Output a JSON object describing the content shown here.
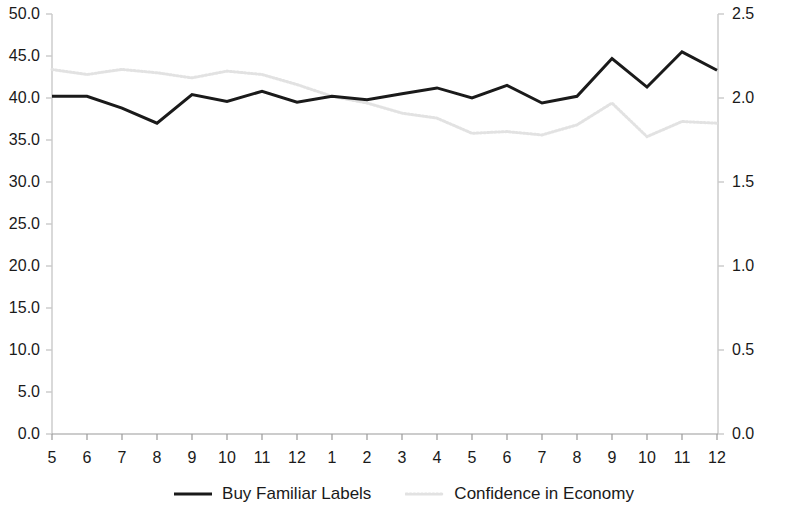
{
  "chart_data": {
    "type": "line",
    "title": "",
    "subtitle": "",
    "xlabel": "",
    "ylabel": "",
    "grid": false,
    "legend_position": "bottom",
    "x": [
      "5",
      "6",
      "7",
      "8",
      "9",
      "10",
      "11",
      "12",
      "1",
      "2",
      "3",
      "4",
      "5",
      "6",
      "7",
      "8",
      "9",
      "10",
      "11",
      "12"
    ],
    "xtick_labels": [
      "5",
      "6",
      "7",
      "8",
      "9",
      "10",
      "11",
      "12",
      "1",
      "2",
      "3",
      "4",
      "5",
      "6",
      "7",
      "8",
      "9",
      "10",
      "11",
      "12"
    ],
    "axes": {
      "left": {
        "label": "",
        "min": 0.0,
        "max": 50.0,
        "step": 5.0,
        "ticks": [
          "0.0",
          "5.0",
          "10.0",
          "15.0",
          "20.0",
          "25.0",
          "30.0",
          "35.0",
          "40.0",
          "45.0",
          "50.0"
        ]
      },
      "right": {
        "label": "",
        "min": 0.0,
        "max": 2.5,
        "step": 0.5,
        "ticks": [
          "0.0",
          "0.5",
          "1.0",
          "1.5",
          "2.0",
          "2.5"
        ]
      }
    },
    "series": [
      {
        "name": "Buy Familiar Labels",
        "axis": "left",
        "color": "#1a1a1a",
        "style": "solid",
        "width": 3,
        "values": [
          40.2,
          40.2,
          38.8,
          37.0,
          40.4,
          39.6,
          40.8,
          39.5,
          40.2,
          39.8,
          40.5,
          41.2,
          40.0,
          41.5,
          39.4,
          40.2,
          44.7,
          41.3,
          45.5,
          43.3
        ]
      },
      {
        "name": "Confidence in Economy",
        "axis": "right",
        "color": "#e2e2e2",
        "style": "dotted",
        "width": 3,
        "values": [
          2.17,
          2.14,
          2.17,
          2.15,
          2.12,
          2.16,
          2.14,
          2.08,
          2.01,
          1.97,
          1.91,
          1.88,
          1.79,
          1.8,
          1.78,
          1.84,
          1.97,
          1.77,
          1.86,
          1.85
        ]
      }
    ]
  },
  "legend": {
    "items": [
      {
        "label": "Buy Familiar Labels",
        "marker": "solid-line-swatch"
      },
      {
        "label": "Confidence in Economy",
        "marker": "dotted-line-swatch"
      }
    ]
  }
}
